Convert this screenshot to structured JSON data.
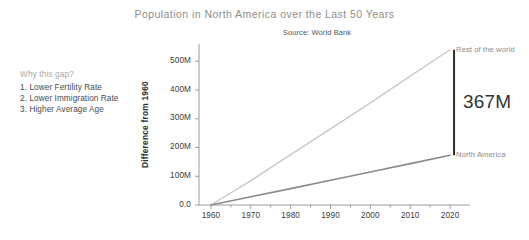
{
  "chart_data": {
    "type": "line",
    "title": "Population in North America over the Last 50 Years",
    "subtitle": "Source: World Bank",
    "xlabel": "",
    "ylabel": "Difference from 1960",
    "xlim": [
      1957,
      2025
    ],
    "ylim": [
      0,
      560
    ],
    "grid": false,
    "legend": "inline-right-of-line-ends",
    "x": [
      1960,
      1970,
      1980,
      1990,
      2000,
      2010,
      2020
    ],
    "ytick_labels": [
      "0.0",
      "100M",
      "200M",
      "300M",
      "400M",
      "500M"
    ],
    "ytick_values": [
      0,
      100,
      200,
      300,
      400,
      500
    ],
    "xtick_labels": [
      "1960",
      "1970",
      "1980",
      "1990",
      "2000",
      "2010",
      "2020"
    ],
    "series": [
      {
        "name": "Rest of the world",
        "color": "#c9c9c9",
        "values": [
          0,
          85,
          175,
          265,
          355,
          448,
          540
        ],
        "end_value": 540
      },
      {
        "name": "North America",
        "color": "#8a8a8a",
        "values": [
          0,
          29,
          57,
          86,
          115,
          144,
          173
        ],
        "end_value": 173
      }
    ],
    "annotations": [
      {
        "name": "gap-bar",
        "label": "367M",
        "value": 367,
        "from_value": 173,
        "to_value": 540,
        "at_x": 2021,
        "color": "#2b2b2b"
      }
    ]
  },
  "notes": {
    "heading": "Why this gap?",
    "items": [
      "1. Lower Fertility Rate",
      "2. Lower Immigration Rate",
      "3. Higher Average Age"
    ]
  },
  "colors": {
    "background": "#ffffff",
    "title": "#8d8d8d",
    "axis": "#9b9b9b",
    "tick_text": "#3a3a3a",
    "rest_of_world": "#c9c9c9",
    "north_america": "#8a8a8a",
    "gap_bar": "#2b2b2b"
  }
}
